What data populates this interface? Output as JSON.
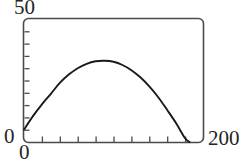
{
  "chart_data": {
    "type": "line",
    "title": "",
    "subtitle": "",
    "xlabel": "",
    "ylabel": "",
    "xlim": [
      0,
      200
    ],
    "ylim": [
      0,
      50
    ],
    "grid": false,
    "legend": null,
    "axis_labels": {
      "y_max": "50",
      "y_min": "0",
      "x_min": "0",
      "x_max": "200"
    },
    "x_tick_interval": 20,
    "y_tick_interval": 5,
    "x_ticks": [
      0,
      20,
      40,
      60,
      80,
      100,
      120,
      140,
      160,
      180,
      200
    ],
    "y_ticks": [
      0,
      5,
      10,
      15,
      20,
      25,
      30,
      35,
      40,
      45,
      50
    ],
    "series": [
      {
        "name": "curve",
        "color": "#1a1a1a",
        "x": [
          0,
          10,
          20,
          30,
          40,
          50,
          60,
          70,
          80,
          90,
          100,
          110,
          120,
          130,
          140,
          150,
          160,
          170,
          180,
          185
        ],
        "y": [
          5.0,
          10.5,
          15.3,
          19.6,
          24.0,
          27.4,
          30.0,
          31.8,
          32.8,
          33.0,
          32.6,
          31.3,
          29.2,
          26.3,
          22.6,
          18.2,
          13.0,
          7.6,
          1.5,
          0.0
        ]
      }
    ],
    "frame_color": "#4a4a4a",
    "curve_color": "#1a1a1a"
  }
}
